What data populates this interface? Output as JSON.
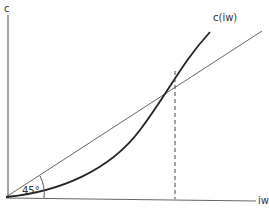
{
  "diagram": {
    "y_axis_label": "c",
    "x_axis_label": "iw",
    "curve_label": "c(iw)",
    "angle_label": "45°",
    "elements": [
      {
        "name": "y-axis",
        "type": "axis"
      },
      {
        "name": "x-axis",
        "type": "axis"
      },
      {
        "name": "45-degree-line",
        "type": "line",
        "angle": "45°"
      },
      {
        "name": "cost-curve",
        "type": "convex-curve",
        "label": "c(iw)"
      },
      {
        "name": "intersection-dropline",
        "type": "dashed-line"
      }
    ],
    "colors": {
      "axis": "#555555",
      "line_45": "#555555",
      "curve": "#222222",
      "text": "#333333"
    }
  }
}
